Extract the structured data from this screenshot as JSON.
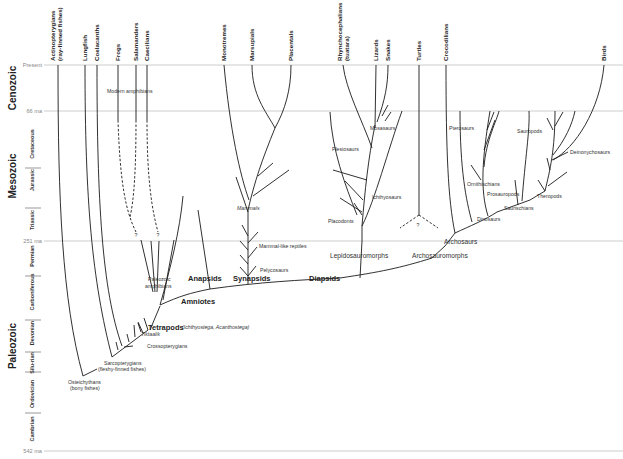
{
  "time_axis": {
    "ticks": [
      {
        "label": "Present",
        "y": 65
      },
      {
        "label": "66 ma",
        "y": 111
      },
      {
        "label": "251 ma",
        "y": 241
      },
      {
        "label": "542 ma",
        "y": 451
      }
    ],
    "eras": [
      {
        "label": "Cenozoic",
        "y": 88
      },
      {
        "label": "Mesozoic",
        "y": 176
      },
      {
        "label": "Paleozoic",
        "y": 346
      }
    ],
    "periods": [
      {
        "label": "Cretaceous",
        "y": 144
      },
      {
        "label": "Jurassic",
        "y": 180
      },
      {
        "label": "Triassic",
        "y": 220
      },
      {
        "label": "Permian",
        "y": 256
      },
      {
        "label": "Carboniferous",
        "y": 292
      },
      {
        "label": "Devonian",
        "y": 333
      },
      {
        "label": "Silu-rian",
        "y": 363
      },
      {
        "label": "Ordovician",
        "y": 394
      },
      {
        "label": "Cambrian",
        "y": 429
      }
    ]
  },
  "tip_labels": [
    {
      "id": "actinopterygians",
      "line1": "Actinopterygians",
      "line2": "(ray-finned fishes)",
      "x": 58
    },
    {
      "id": "lungfish",
      "line1": "Lungfish",
      "x": 85
    },
    {
      "id": "coelacanths",
      "line1": "Coelacanths",
      "x": 97
    },
    {
      "id": "frogs",
      "line1": "Frogs",
      "x": 118
    },
    {
      "id": "salamanders",
      "line1": "Salamanders",
      "x": 136
    },
    {
      "id": "caecilians",
      "line1": "Caecilians",
      "x": 147
    },
    {
      "id": "monotremes",
      "line1": "Monotremes",
      "x": 224
    },
    {
      "id": "marsupials",
      "line1": "Marsupials",
      "x": 252
    },
    {
      "id": "placentals",
      "line1": "Placentals",
      "x": 291
    },
    {
      "id": "rhynchocephalians",
      "line1": "Rhynchocephalians",
      "line2": "(tuatara)",
      "x": 343
    },
    {
      "id": "lizards",
      "line1": "Lizards",
      "x": 376
    },
    {
      "id": "snakes",
      "line1": "Snakes",
      "x": 388
    },
    {
      "id": "turtles",
      "line1": "Turtles",
      "x": 419
    },
    {
      "id": "crocodilians",
      "line1": "Crocodilians",
      "x": 446
    },
    {
      "id": "birds",
      "line1": "Birds",
      "x": 604
    }
  ],
  "clade_labels": {
    "bold": [
      {
        "text": "Tetrapods",
        "x": 148,
        "y": 329
      },
      {
        "text": "Amniotes",
        "x": 181,
        "y": 304
      },
      {
        "text": "Anapsids",
        "x": 188,
        "y": 281
      },
      {
        "text": "Synapsids",
        "x": 233,
        "y": 281
      },
      {
        "text": "Diapsids",
        "x": 309,
        "y": 281
      }
    ],
    "medium": [
      {
        "text": "Lepidosauromorphs",
        "x": 330,
        "y": 258
      },
      {
        "text": "Archosauromorphs",
        "x": 412,
        "y": 258
      },
      {
        "text": "Archosaurs",
        "x": 444,
        "y": 244
      }
    ],
    "small": [
      {
        "text": "Modern amphibians",
        "x": 107,
        "y": 93
      },
      {
        "text": "Paleozoic",
        "x": 148,
        "y": 281
      },
      {
        "text": "amphibians",
        "x": 145,
        "y": 288
      },
      {
        "text": "Tiktaalik",
        "x": 141,
        "y": 336
      },
      {
        "text": "Crossopterygians",
        "x": 147,
        "y": 348
      },
      {
        "text": "Sarcopterygians",
        "x": 104,
        "y": 365
      },
      {
        "text": "(fleshy-finned fishes)",
        "x": 98,
        "y": 371
      },
      {
        "text": "Osteichythans",
        "x": 68,
        "y": 384
      },
      {
        "text": "(bony fishes)",
        "x": 70,
        "y": 390
      },
      {
        "text": "Mammals",
        "x": 237,
        "y": 210
      },
      {
        "text": "Mammal-like reptiles",
        "x": 259,
        "y": 248
      },
      {
        "text": "Pelycosaurs",
        "x": 260,
        "y": 272
      },
      {
        "text": "Plesiosaurs",
        "x": 332,
        "y": 151
      },
      {
        "text": "Mosasaurs",
        "x": 370,
        "y": 130
      },
      {
        "text": "Ichthyosaurs",
        "x": 372,
        "y": 199
      },
      {
        "text": "Placodonts",
        "x": 328,
        "y": 223
      },
      {
        "text": "Pterosaurs",
        "x": 449,
        "y": 130
      },
      {
        "text": "Sauropods",
        "x": 517,
        "y": 133
      },
      {
        "text": "Deinonychosaurs",
        "x": 570,
        "y": 154
      },
      {
        "text": "Ornithischians",
        "x": 467,
        "y": 186
      },
      {
        "text": "Prosauropods",
        "x": 487,
        "y": 196
      },
      {
        "text": "Theropods",
        "x": 537,
        "y": 198
      },
      {
        "text": "Saurischians",
        "x": 504,
        "y": 210
      },
      {
        "text": "Dinosaurs",
        "x": 477,
        "y": 221
      }
    ],
    "annotation": {
      "text": "(Ichthyostega, Acanthostega)",
      "x": 182,
      "y": 329
    }
  },
  "uncertainty_marks": [
    {
      "text": "?",
      "x": 136,
      "y": 237
    },
    {
      "text": "?",
      "x": 158,
      "y": 237
    },
    {
      "text": "?",
      "x": 418,
      "y": 227
    }
  ]
}
